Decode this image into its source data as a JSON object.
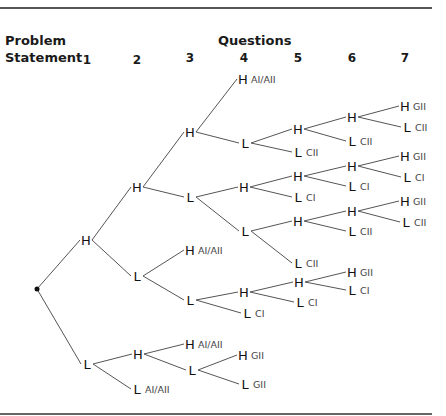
{
  "header": {
    "row_label_line1": "Problem",
    "row_label_line2": "Statement",
    "group_label": "Questions",
    "columns": [
      {
        "label": "1",
        "x": 87
      },
      {
        "label": "2",
        "x": 137
      },
      {
        "label": "3",
        "x": 190
      },
      {
        "label": "4",
        "x": 244
      },
      {
        "label": "5",
        "x": 298
      },
      {
        "label": "6",
        "x": 352
      },
      {
        "label": "7",
        "x": 405
      }
    ]
  },
  "tree": {
    "root": {
      "x": 37,
      "y": 289
    },
    "nodes": [
      {
        "id": "n1",
        "sym": "H",
        "x": 86,
        "y": 240,
        "parent": "root"
      },
      {
        "id": "n2",
        "sym": "L",
        "x": 87,
        "y": 364,
        "parent": "root"
      },
      {
        "id": "n3",
        "sym": "H",
        "x": 137,
        "y": 187,
        "parent": "n1"
      },
      {
        "id": "n4",
        "sym": "L",
        "x": 137,
        "y": 276,
        "parent": "n1"
      },
      {
        "id": "n5",
        "sym": "H",
        "x": 190,
        "y": 132,
        "parent": "n3"
      },
      {
        "id": "n6",
        "sym": "L",
        "x": 190,
        "y": 197,
        "parent": "n3"
      },
      {
        "id": "n7",
        "sym": "H",
        "x": 243,
        "y": 79,
        "parent": "n5",
        "tag": "AI/AII"
      },
      {
        "id": "n8",
        "sym": "L",
        "x": 245,
        "y": 143,
        "parent": "n5"
      },
      {
        "id": "n9",
        "sym": "H",
        "x": 298,
        "y": 129,
        "parent": "n8"
      },
      {
        "id": "n10",
        "sym": "L",
        "x": 298,
        "y": 152,
        "parent": "n8",
        "tag": "CII"
      },
      {
        "id": "n11",
        "sym": "H",
        "x": 352,
        "y": 117,
        "parent": "n9"
      },
      {
        "id": "n12",
        "sym": "L",
        "x": 352,
        "y": 141,
        "parent": "n9",
        "tag": "CII"
      },
      {
        "id": "n13",
        "sym": "H",
        "x": 405,
        "y": 106,
        "parent": "n11",
        "tag": "GII"
      },
      {
        "id": "n14",
        "sym": "L",
        "x": 407,
        "y": 127,
        "parent": "n11",
        "tag": "CII"
      },
      {
        "id": "n15",
        "sym": "H",
        "x": 244,
        "y": 187,
        "parent": "n6"
      },
      {
        "id": "n16",
        "sym": "L",
        "x": 245,
        "y": 231,
        "parent": "n6"
      },
      {
        "id": "n17",
        "sym": "H",
        "x": 298,
        "y": 176,
        "parent": "n15"
      },
      {
        "id": "n18",
        "sym": "L",
        "x": 298,
        "y": 197,
        "parent": "n15",
        "tag": "CI"
      },
      {
        "id": "n19",
        "sym": "H",
        "x": 352,
        "y": 166,
        "parent": "n17"
      },
      {
        "id": "n20",
        "sym": "L",
        "x": 352,
        "y": 186,
        "parent": "n17",
        "tag": "CI"
      },
      {
        "id": "n21",
        "sym": "H",
        "x": 405,
        "y": 156,
        "parent": "n19",
        "tag": "GII"
      },
      {
        "id": "n22",
        "sym": "L",
        "x": 407,
        "y": 177,
        "parent": "n19",
        "tag": "CI"
      },
      {
        "id": "n23",
        "sym": "H",
        "x": 298,
        "y": 221,
        "parent": "n16"
      },
      {
        "id": "n24",
        "sym": "L",
        "x": 298,
        "y": 263,
        "parent": "n16",
        "tag": "CII"
      },
      {
        "id": "n25",
        "sym": "H",
        "x": 352,
        "y": 211,
        "parent": "n23"
      },
      {
        "id": "n26",
        "sym": "L",
        "x": 352,
        "y": 231,
        "parent": "n23",
        "tag": "CII"
      },
      {
        "id": "n27",
        "sym": "H",
        "x": 405,
        "y": 201,
        "parent": "n25",
        "tag": "GII"
      },
      {
        "id": "n28",
        "sym": "L",
        "x": 406,
        "y": 222,
        "parent": "n25",
        "tag": "CII"
      },
      {
        "id": "n29",
        "sym": "H",
        "x": 190,
        "y": 250,
        "parent": "n4",
        "tag": "AI/AII"
      },
      {
        "id": "n30",
        "sym": "L",
        "x": 190,
        "y": 300,
        "parent": "n4"
      },
      {
        "id": "n31",
        "sym": "H",
        "x": 244,
        "y": 292,
        "parent": "n30"
      },
      {
        "id": "n32",
        "sym": "L",
        "x": 247,
        "y": 313,
        "parent": "n30",
        "tag": "CI"
      },
      {
        "id": "n33",
        "sym": "H",
        "x": 299,
        "y": 282,
        "parent": "n31"
      },
      {
        "id": "n34",
        "sym": "L",
        "x": 300,
        "y": 302,
        "parent": "n31",
        "tag": "CI"
      },
      {
        "id": "n35",
        "sym": "H",
        "x": 352,
        "y": 272,
        "parent": "n33",
        "tag": "GII"
      },
      {
        "id": "n36",
        "sym": "L",
        "x": 352,
        "y": 290,
        "parent": "n33",
        "tag": "CI"
      },
      {
        "id": "n37",
        "sym": "H",
        "x": 138,
        "y": 354,
        "parent": "n2"
      },
      {
        "id": "n38",
        "sym": "L",
        "x": 137,
        "y": 389,
        "parent": "n2",
        "tag": "AI/AII"
      },
      {
        "id": "n39",
        "sym": "H",
        "x": 190,
        "y": 344,
        "parent": "n37",
        "tag": "AI/AII"
      },
      {
        "id": "n40",
        "sym": "L",
        "x": 192,
        "y": 370,
        "parent": "n37"
      },
      {
        "id": "n41",
        "sym": "H",
        "x": 243,
        "y": 355,
        "parent": "n40",
        "tag": "GII"
      },
      {
        "id": "n42",
        "sym": "L",
        "x": 245,
        "y": 384,
        "parent": "n40",
        "tag": "GII"
      }
    ]
  }
}
